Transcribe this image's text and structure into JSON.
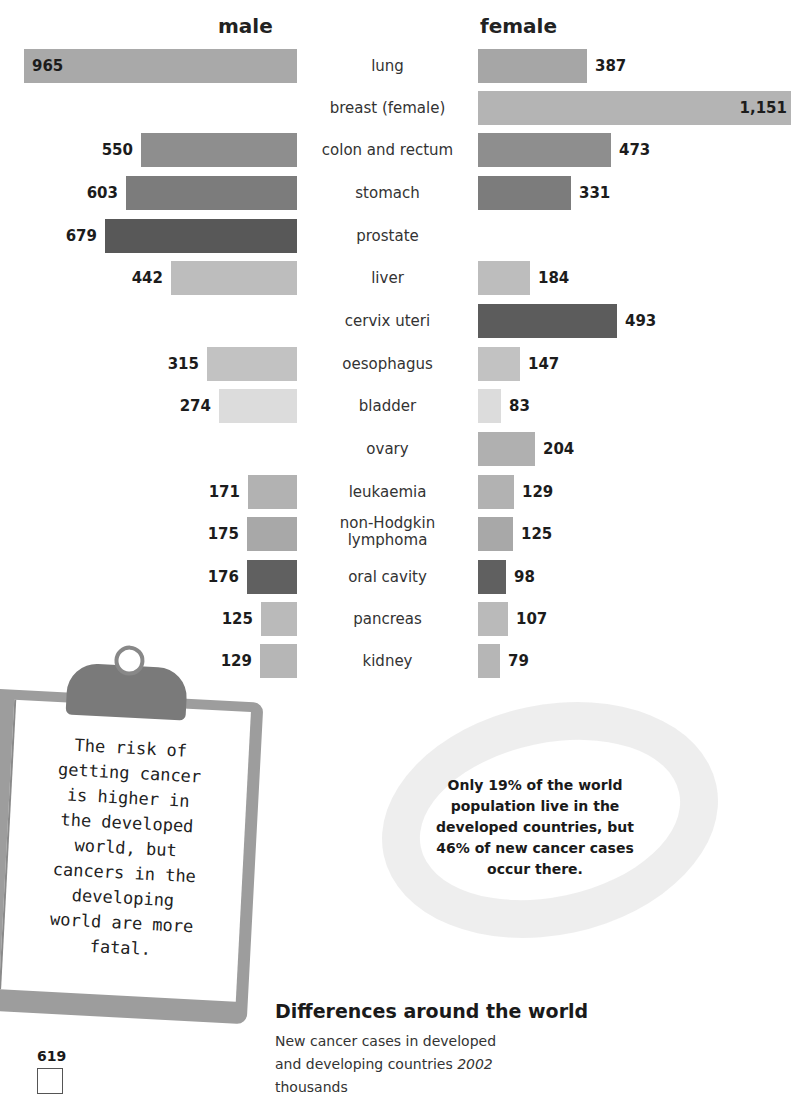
{
  "headers": {
    "male": "male",
    "female": "female"
  },
  "chart_data": {
    "type": "bar",
    "title": "New cancer cases in developed and developing countries 2002",
    "subtitle": "thousands",
    "layout": "back-to-back horizontal bars (male left, female right)",
    "categories": [
      "lung",
      "breast (female)",
      "colon and rectum",
      "stomach",
      "prostate",
      "liver",
      "cervix uteri",
      "oesophagus",
      "bladder",
      "ovary",
      "leukaemia",
      "non-Hodgkin lymphoma",
      "oral cavity",
      "pancreas",
      "kidney"
    ],
    "series": [
      {
        "name": "male",
        "values": [
          965,
          null,
          550,
          603,
          679,
          442,
          null,
          315,
          274,
          null,
          171,
          175,
          176,
          125,
          129
        ]
      },
      {
        "name": "female",
        "values": [
          387,
          1151,
          473,
          331,
          null,
          184,
          493,
          147,
          83,
          204,
          129,
          125,
          98,
          107,
          79
        ]
      }
    ],
    "xlabel": "",
    "ylabel": "",
    "grid": false,
    "legend": "column headers 'male' / 'female'"
  },
  "rows": [
    {
      "label": "lung",
      "male": "965",
      "female": "387",
      "mw": 273,
      "fw": 109,
      "mc": "#a9a9a9",
      "fc": "#a6a6a6",
      "y": 49
    },
    {
      "label": "breast (female)",
      "male": "",
      "female": "1,151",
      "mw": 0,
      "fw": 313,
      "mc": "#b4b4b4",
      "fc": "#b4b4b4",
      "y": 91
    },
    {
      "label": "colon and rectum",
      "male": "550",
      "female": "473",
      "mw": 156,
      "fw": 133,
      "mc": "#8e8e8e",
      "fc": "#8e8e8e",
      "y": 133
    },
    {
      "label": "stomach",
      "male": "603",
      "female": "331",
      "mw": 171,
      "fw": 93,
      "mc": "#7c7c7c",
      "fc": "#7c7c7c",
      "y": 176
    },
    {
      "label": "prostate",
      "male": "679",
      "female": "",
      "mw": 192,
      "fw": 0,
      "mc": "#585858",
      "fc": "#585858",
      "y": 219
    },
    {
      "label": "liver",
      "male": "442",
      "female": "184",
      "mw": 126,
      "fw": 52,
      "mc": "#bdbdbd",
      "fc": "#bdbdbd",
      "y": 261
    },
    {
      "label": "cervix uteri",
      "male": "",
      "female": "493",
      "mw": 0,
      "fw": 139,
      "mc": "#5c5c5c",
      "fc": "#5c5c5c",
      "y": 304
    },
    {
      "label": "oesophagus",
      "male": "315",
      "female": "147",
      "mw": 90,
      "fw": 42,
      "mc": "#c2c2c2",
      "fc": "#c2c2c2",
      "y": 347
    },
    {
      "label": "bladder",
      "male": "274",
      "female": "83",
      "mw": 78,
      "fw": 23,
      "mc": "#dcdcdc",
      "fc": "#dcdcdc",
      "y": 389
    },
    {
      "label": "ovary",
      "male": "",
      "female": "204",
      "mw": 0,
      "fw": 57,
      "mc": "#b0b0b0",
      "fc": "#b0b0b0",
      "y": 432
    },
    {
      "label": "leukaemia",
      "male": "171",
      "female": "129",
      "mw": 49,
      "fw": 36,
      "mc": "#b2b2b2",
      "fc": "#b2b2b2",
      "y": 475
    },
    {
      "label": "non-Hodgkin",
      "label2": "lymphoma",
      "male": "175",
      "female": "125",
      "mw": 50,
      "fw": 35,
      "mc": "#a8a8a8",
      "fc": "#a8a8a8",
      "y": 517
    },
    {
      "label": "oral cavity",
      "male": "176",
      "female": "98",
      "mw": 50,
      "fw": 28,
      "mc": "#606060",
      "fc": "#606060",
      "y": 560
    },
    {
      "label": "pancreas",
      "male": "125",
      "female": "107",
      "mw": 36,
      "fw": 30,
      "mc": "#bababa",
      "fc": "#bababa",
      "y": 602
    },
    {
      "label": "kidney",
      "male": "129",
      "female": "79",
      "mw": 37,
      "fw": 22,
      "mc": "#b6b6b6",
      "fc": "#b6b6b6",
      "y": 644
    }
  ],
  "clipboard": {
    "lines": [
      "The risk of",
      "getting cancer",
      "is higher in",
      "the developed",
      "world, but",
      "cancers in the",
      "developing",
      "world are more",
      "fatal."
    ]
  },
  "note": {
    "lines": [
      "Only 19% of the world",
      "population live in the",
      "developed countries, but",
      "46% of new cancer cases",
      "occur there."
    ]
  },
  "section": {
    "title": "Differences around the world",
    "subtitle_line1": "New cancer cases in developed",
    "subtitle_line2": "and developing countries",
    "year": "2002",
    "subtitle_line3": "thousands"
  },
  "mini_chart": {
    "value": "619"
  }
}
